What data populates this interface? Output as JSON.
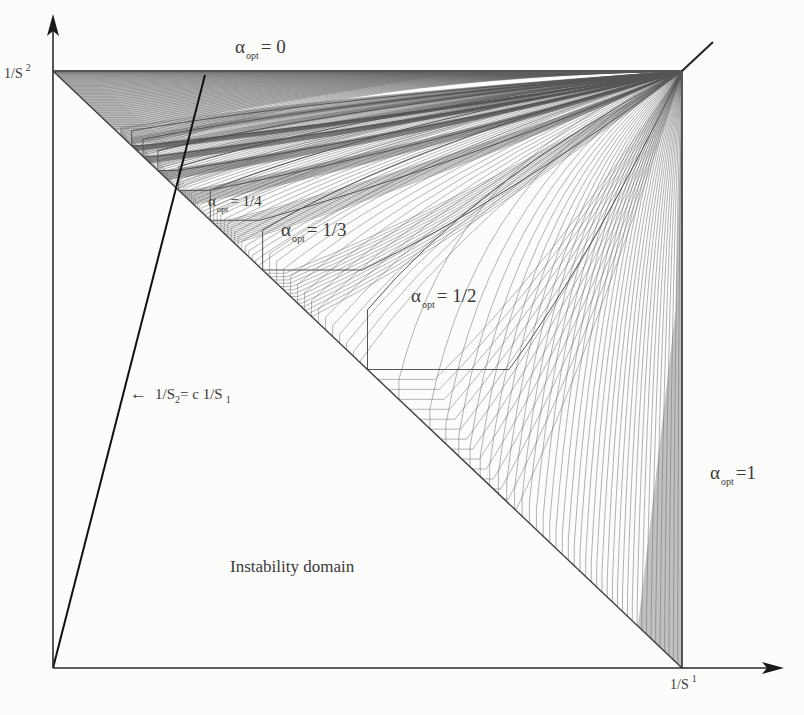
{
  "diagram": {
    "type": "stability-region-map",
    "axes": {
      "x_label": {
        "base": "1/S",
        "index": "1"
      },
      "y_label": {
        "base": "1/S",
        "index": "2"
      }
    },
    "regions": [
      {
        "id": "alpha-0",
        "symbol": "α",
        "sub": "opt",
        "value": "= 0"
      },
      {
        "id": "alpha-1-4",
        "symbol": "α",
        "sub": "opt",
        "value": "= 1/4"
      },
      {
        "id": "alpha-1-3",
        "symbol": "α",
        "sub": "opt",
        "value": "= 1/3"
      },
      {
        "id": "alpha-1-2",
        "symbol": "α",
        "sub": "opt",
        "value": "= 1/2"
      },
      {
        "id": "alpha-1",
        "symbol": "α",
        "sub": "opt",
        "value": "=1"
      }
    ],
    "instability_label": "Instability domain",
    "line_annotation": {
      "arrow": "←",
      "text_a": "1/S",
      "sub_a": "2",
      "text_b": "= c 1/S",
      "sub_b": "1"
    },
    "colors": {
      "axis": "#2a2a2a",
      "curves": "#555555",
      "dense_band": "#6a6a6a",
      "background": "#fcfcfb"
    },
    "geometry": {
      "origin": [
        53,
        668
      ],
      "square_size": [
        629,
        597
      ],
      "y_arrow_tip": [
        53,
        14
      ],
      "x_arrow_tip": [
        784,
        668
      ],
      "ray_end": [
        205,
        75
      ],
      "tail_end": [
        713,
        42
      ],
      "breakpoints": [
        0.5,
        0.3333,
        0.25,
        0.2,
        0.1667,
        0.1429,
        0.125
      ]
    }
  }
}
